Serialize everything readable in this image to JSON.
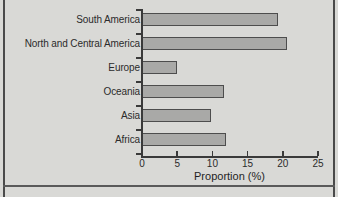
{
  "chart_data": {
    "type": "bar",
    "orientation": "horizontal",
    "title": "",
    "xlabel": "Proportion (%)",
    "ylabel": "",
    "xlim": [
      0,
      25
    ],
    "xticks": [
      0,
      5,
      10,
      15,
      20,
      25
    ],
    "xtick_labels": [
      "0",
      "5",
      "10",
      "15",
      "20",
      "25"
    ],
    "grid": false,
    "legend": false,
    "categories": [
      "South America",
      "North and Central America",
      "Europe",
      "Oceania",
      "Asia",
      "Africa"
    ],
    "values": [
      19.3,
      20.6,
      5.0,
      11.7,
      9.8,
      11.9
    ],
    "series": [
      {
        "name": "Proportion",
        "values": [
          19.3,
          20.6,
          5.0,
          11.7,
          9.8,
          11.9
        ]
      }
    ],
    "bar_fill_color": "#a9a9a7",
    "bar_edge_color": "#4d4d4d",
    "background_color": "#d9d9d6",
    "axis_color": "#3a3a3a"
  },
  "axes": {
    "x_title": "Proportion (%)"
  }
}
